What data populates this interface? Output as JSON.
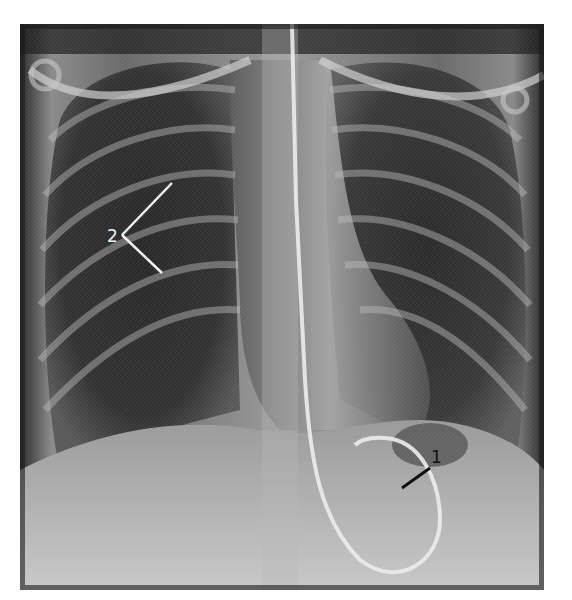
{
  "figure": {
    "type": "chest-radiograph-pa",
    "background": "#ffffff",
    "image_bounds": {
      "x": 20,
      "y": 24,
      "width": 524,
      "height": 566
    }
  },
  "annotations": [
    {
      "id": "1",
      "label": "1",
      "text_color": "#111111",
      "pointer_color": "#111111",
      "text_pos": {
        "x": 440,
        "y": 470
      },
      "pointer": {
        "x1": 430,
        "y1": 468,
        "x2": 402,
        "y2": 488
      }
    },
    {
      "id": "2",
      "label": "2",
      "text_color": "#f2f2f2",
      "pointer_color": "#f2f2f2",
      "text_pos": {
        "x": 107,
        "y": 242
      },
      "pointer_arms": [
        {
          "x1": 122,
          "y1": 235,
          "x2": 172,
          "y2": 183
        },
        {
          "x1": 122,
          "y1": 235,
          "x2": 162,
          "y2": 273
        }
      ]
    }
  ]
}
